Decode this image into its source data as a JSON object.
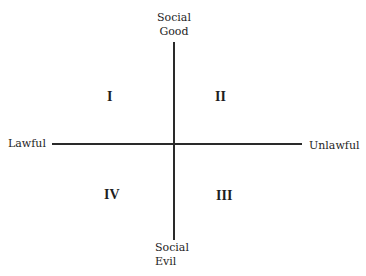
{
  "axes": {
    "top": [
      "Social",
      "Good"
    ],
    "bottom": [
      "Social",
      "Evil"
    ],
    "left": "Lawful",
    "right": "Unlawful"
  },
  "quadrants": {
    "top_left": "I",
    "top_right": "II",
    "bottom_right": "III",
    "bottom_left": "IV"
  }
}
